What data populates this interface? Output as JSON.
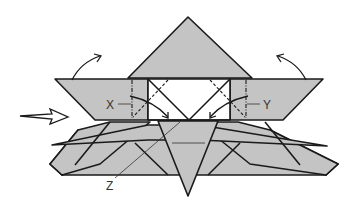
{
  "diagram": {
    "type": "origami-fold-diagram",
    "labels": {
      "x": "X",
      "y": "Y",
      "z": "Z"
    },
    "colors": {
      "paper": "#c4c4c4",
      "line": "#1a1a1a",
      "background": "#ffffff"
    }
  }
}
